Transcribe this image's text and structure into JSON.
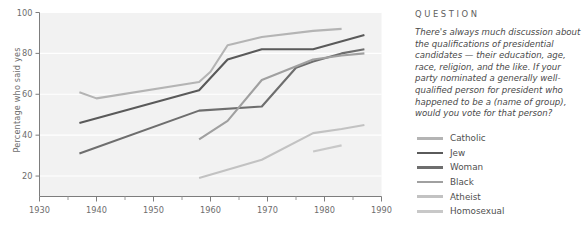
{
  "side_panel": {
    "heading": "QUESTION",
    "question_text": "There's always much discussion about the qualifications of presidential candidates — their education, age, race, religion, and the like. If your party nominated a generally well-qualified person for president who happened to be a (name of group), would you vote for that person?"
  },
  "chart_data": {
    "type": "line",
    "title": "",
    "xlabel": "",
    "ylabel": "Percentage who said yes",
    "xlim": [
      1930,
      1990
    ],
    "ylim": [
      10,
      100
    ],
    "xticks": [
      1930,
      1940,
      1950,
      1960,
      1970,
      1980,
      1990
    ],
    "xtick_labels": [
      "1930",
      "1940",
      "1950",
      "1960",
      "1970",
      "1980",
      "1990"
    ],
    "xminor_ticks": [
      1935,
      1945,
      1955,
      1965,
      1975,
      1985
    ],
    "yticks": [
      20,
      40,
      60,
      80,
      100
    ],
    "ytick_labels": [
      "20",
      "40",
      "60",
      "80",
      "100"
    ],
    "grid": true,
    "grid_axis": "y",
    "legend_position": "right",
    "plot_background": "#f2f2f2",
    "series": [
      {
        "name": "Catholic",
        "color": "#b4b4b4",
        "x": [
          1937,
          1940,
          1958,
          1960,
          1963,
          1969,
          1978,
          1983
        ],
        "y": [
          61,
          58,
          66,
          71,
          84,
          88,
          91,
          92
        ]
      },
      {
        "name": "Jew",
        "color": "#5a5a5a",
        "x": [
          1937,
          1958,
          1963,
          1969,
          1978,
          1987
        ],
        "y": [
          46,
          62,
          77,
          82,
          82,
          89
        ]
      },
      {
        "name": "Woman",
        "color": "#6e6e6e",
        "x": [
          1937,
          1958,
          1969,
          1975,
          1978,
          1983,
          1987
        ],
        "y": [
          31,
          52,
          54,
          73,
          76,
          80,
          82
        ]
      },
      {
        "name": "Black",
        "color": "#a0a0a0",
        "x": [
          1958,
          1963,
          1969,
          1978,
          1983,
          1987
        ],
        "y": [
          38,
          47,
          67,
          77,
          79,
          80
        ]
      },
      {
        "name": "Atheist",
        "color": "#c2c2c2",
        "x": [
          1958,
          1969,
          1978,
          1983,
          1987
        ],
        "y": [
          19,
          28,
          41,
          43,
          45
        ]
      },
      {
        "name": "Homosexual",
        "color": "#c8c8c8",
        "x": [
          1978,
          1983
        ],
        "y": [
          32,
          35
        ]
      }
    ]
  }
}
